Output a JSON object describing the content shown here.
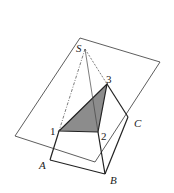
{
  "diagram": {
    "colors": {
      "stroke": "#222222",
      "plane_stroke": "#333333",
      "section_fill": "#8c8c8c",
      "background": "#ffffff"
    },
    "labels": {
      "S": "S",
      "A": "A",
      "B": "B",
      "C": "C",
      "p1": "1",
      "p2": "2",
      "p3": "3"
    },
    "vertices": {
      "S": [
        85,
        49
      ],
      "A": [
        50,
        160
      ],
      "B": [
        105,
        174
      ],
      "C": [
        128,
        117
      ],
      "p1": [
        59,
        131
      ],
      "p2": [
        98,
        132
      ],
      "p3": [
        107,
        84
      ]
    },
    "plane": [
      [
        80,
        38
      ],
      [
        160,
        62
      ],
      [
        95,
        162
      ],
      [
        15,
        136
      ]
    ]
  }
}
